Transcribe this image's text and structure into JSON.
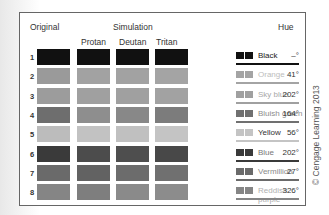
{
  "headers": {
    "original": "Original",
    "simulation": "Simulation",
    "protan": "Protan",
    "deutan": "Deutan",
    "tritan": "Tritan",
    "hue": "Hue"
  },
  "rows": [
    {
      "num": "1",
      "name": "Black",
      "hue": "–°",
      "gray": [
        "#111111",
        "#111111",
        "#111111",
        "#111111"
      ],
      "name_color": "#222222",
      "bar": "#111111"
    },
    {
      "num": "2",
      "name": "Orange",
      "hue": "41°",
      "gray": [
        "#9a9a9a",
        "#a2a2a2",
        "#a2a2a2",
        "#a4a4a4"
      ],
      "name_color": "#bdbdbd",
      "bar": "#a4a4a4"
    },
    {
      "num": "3",
      "name": "Sky blue",
      "hue": "202°",
      "gray": [
        "#9c9c9c",
        "#a0a0a0",
        "#a0a0a0",
        "#a2a2a2"
      ],
      "name_color": "#a8a8a8",
      "bar": "#a0a0a0"
    },
    {
      "num": "4",
      "name": "Bluish green",
      "hue": "164°",
      "gray": [
        "#6e6e6e",
        "#8e8e8e",
        "#888888",
        "#7c7c7c"
      ],
      "name_color": "#8c8c8c",
      "bar": "#707070"
    },
    {
      "num": "5",
      "name": "Yellow",
      "hue": "56°",
      "gray": [
        "#bcbcbc",
        "#c2c2c2",
        "#c0c0c0",
        "#c4c4c4"
      ],
      "name_color": "#333333",
      "bar": "#c4c4c4"
    },
    {
      "num": "6",
      "name": "Blue",
      "hue": "202°",
      "gray": [
        "#3a3a3a",
        "#4c4c4c",
        "#4e4e4e",
        "#484848"
      ],
      "name_color": "#777777",
      "bar": "#3a3a3a"
    },
    {
      "num": "7",
      "name": "Vermillion",
      "hue": "27°",
      "gray": [
        "#6a6a6a",
        "#626262",
        "#6c6c6c",
        "#707070"
      ],
      "name_color": "#8a8a8a",
      "bar": "#6a6a6a"
    },
    {
      "num": "8",
      "name": "Reddish purple",
      "hue": "326°",
      "gray": [
        "#858585",
        "#7e7e7e",
        "#8a8a8a",
        "#8c8c8c"
      ],
      "name_color": "#b0b0b0",
      "bar": "#858585"
    }
  ],
  "credit": "© Cengage Learning 2013"
}
